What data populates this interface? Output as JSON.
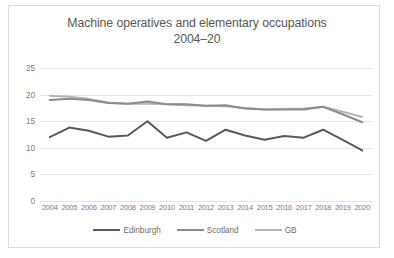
{
  "chart_data": {
    "type": "line",
    "title": "Machine operatives and elementary occupations 2004–20",
    "title_line1": "Machine operatives and elementary occupations",
    "title_line2": "2004–20",
    "xlabel": "",
    "ylabel": "",
    "ylim": [
      0,
      25
    ],
    "yticks": [
      25,
      20,
      15,
      10,
      5,
      0
    ],
    "grid": true,
    "legend_position": "bottom",
    "categories": [
      "2004",
      "2005",
      "2006",
      "2007",
      "2008",
      "2009",
      "2010",
      "2011",
      "2012",
      "2013",
      "2014",
      "2015",
      "2016",
      "2017",
      "2018",
      "2019",
      "2020"
    ],
    "series": [
      {
        "name": "Edinburgh",
        "color": "#5a5a5a",
        "values": [
          12.0,
          13.8,
          13.2,
          12.1,
          12.3,
          15.0,
          11.9,
          12.9,
          11.3,
          13.4,
          12.3,
          11.5,
          12.2,
          11.9,
          13.4,
          11.5,
          9.5
        ]
      },
      {
        "name": "Scotland",
        "color": "#8c8c8c",
        "values": [
          19.0,
          19.2,
          19.0,
          18.4,
          18.3,
          18.7,
          18.2,
          18.2,
          17.9,
          18.0,
          17.4,
          17.2,
          17.2,
          17.2,
          17.7,
          16.3,
          14.8
        ]
      },
      {
        "name": "GB",
        "color": "#b4b4b4",
        "values": [
          19.8,
          19.6,
          19.2,
          18.5,
          18.3,
          18.3,
          18.2,
          18.0,
          17.9,
          17.8,
          17.5,
          17.2,
          17.3,
          17.4,
          17.7,
          16.8,
          15.8
        ]
      }
    ]
  }
}
